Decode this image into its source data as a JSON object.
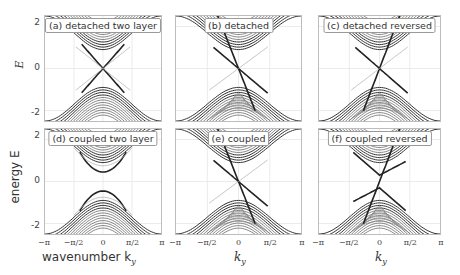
{
  "chart_data": {
    "type": "line",
    "title": "",
    "layout": "2x3 grid of band-structure panels",
    "xlabel": "wavenumber k_y",
    "ylabel": "energy E",
    "xlim": [
      -3.1416,
      3.1416
    ],
    "ylim": [
      -2.5,
      2.5
    ],
    "xticks": [
      "-π",
      "-π/2",
      "0",
      "π/2",
      "π"
    ],
    "yticks": [
      "2",
      "0",
      "-2"
    ],
    "grid": true,
    "panels": [
      {
        "id": "a",
        "label": "(a) detached two layer",
        "gap": 0.0,
        "edge_mode": "symmetric_cross",
        "coupled": false
      },
      {
        "id": "b",
        "label": "(b) detached",
        "gap": 0.0,
        "edge_mode": "tilted_cross",
        "coupled": false
      },
      {
        "id": "c",
        "label": "(c) detached reversed",
        "gap": 0.0,
        "edge_mode": "reversed_cross",
        "coupled": false
      },
      {
        "id": "d",
        "label": "(d) coupled two layer",
        "gap": 0.45,
        "edge_mode": "gapped",
        "coupled": true
      },
      {
        "id": "e",
        "label": "(e) coupled",
        "gap": 0.0,
        "edge_mode": "tilted_cross",
        "coupled": true
      },
      {
        "id": "f",
        "label": "(f) coupled reversed",
        "gap": 0.3,
        "edge_mode": "reversed_gapped",
        "coupled": true
      }
    ]
  },
  "axes": {
    "top_y_label": "E",
    "bottom_y_label": "energy E",
    "x_label_left": "wavenumber k",
    "x_label_sub": "y",
    "x_label_mid": "k",
    "ytick_2": "2",
    "ytick_0": "0",
    "ytick_m2": "-2",
    "xt_mpi": "−π",
    "xt_mpi2": "−π/2",
    "xt_0": "0",
    "xt_pi2": "π/2",
    "xt_pi": "π"
  }
}
